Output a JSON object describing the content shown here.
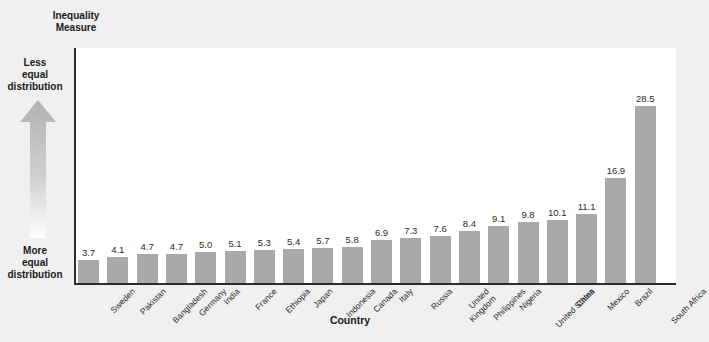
{
  "chart_data": {
    "type": "bar",
    "title": "Inequality Measure",
    "xlabel": "Country",
    "ylabel": "Inequality Measure",
    "ylim": [
      0,
      31
    ],
    "grid": false,
    "legend": null,
    "categories": [
      "Sweden",
      "Pakistan",
      "Bangladesh",
      "Germany",
      "India",
      "France",
      "Ethiopia",
      "Japan",
      "Indonesia",
      "Canada",
      "Italy",
      "Russia",
      "United Kingdom",
      "Philippines",
      "Nigeria",
      "United States",
      "China",
      "Mexico",
      "Brazil",
      "South Africa"
    ],
    "values": [
      3.7,
      4.1,
      4.7,
      4.7,
      5.0,
      5.1,
      5.3,
      5.4,
      5.7,
      5.8,
      6.9,
      7.3,
      7.6,
      8.4,
      9.1,
      9.8,
      10.1,
      11.1,
      16.9,
      28.5
    ],
    "value_labels": [
      "3.7",
      "4.1",
      "4.7",
      "4.7",
      "5.0",
      "5.1",
      "5.3",
      "5.4",
      "5.7",
      "5.8",
      "6.9",
      "7.3",
      "7.6",
      "8.4",
      "9.1",
      "9.8",
      "10.1",
      "11.1",
      "16.9",
      "28.5"
    ],
    "category_label_lines": [
      [
        "Sweden"
      ],
      [
        "Pakistan"
      ],
      [
        "Bangladesh"
      ],
      [
        "Germany"
      ],
      [
        "India"
      ],
      [
        "France"
      ],
      [
        "Ethiopia"
      ],
      [
        "Japan"
      ],
      [
        "Indonesia"
      ],
      [
        "Canada"
      ],
      [
        "Italy"
      ],
      [
        "Russia"
      ],
      [
        "United",
        "Kingdom"
      ],
      [
        "Philippines"
      ],
      [
        "Nigeria"
      ],
      [
        "United States"
      ],
      [
        "China"
      ],
      [
        "Mexico"
      ],
      [
        "Brazil"
      ],
      [
        "South Africa"
      ]
    ],
    "annotations": {
      "axis_title_lines": [
        "Inequality",
        "Measure"
      ],
      "top_direction_lines": [
        "Less",
        "equal",
        "distribution"
      ],
      "bottom_direction_lines": [
        "More",
        "equal",
        "distribution"
      ],
      "arrow_direction": "up"
    },
    "colors": {
      "bar": "#a9a9a9",
      "axis": "#2b2b2b",
      "plot_background": "#ffffff",
      "page_background": "#f0f0f0",
      "text": "#1a1a1a",
      "arrow_top": "#b0b0b0",
      "arrow_bottom": "#ffffff"
    }
  }
}
